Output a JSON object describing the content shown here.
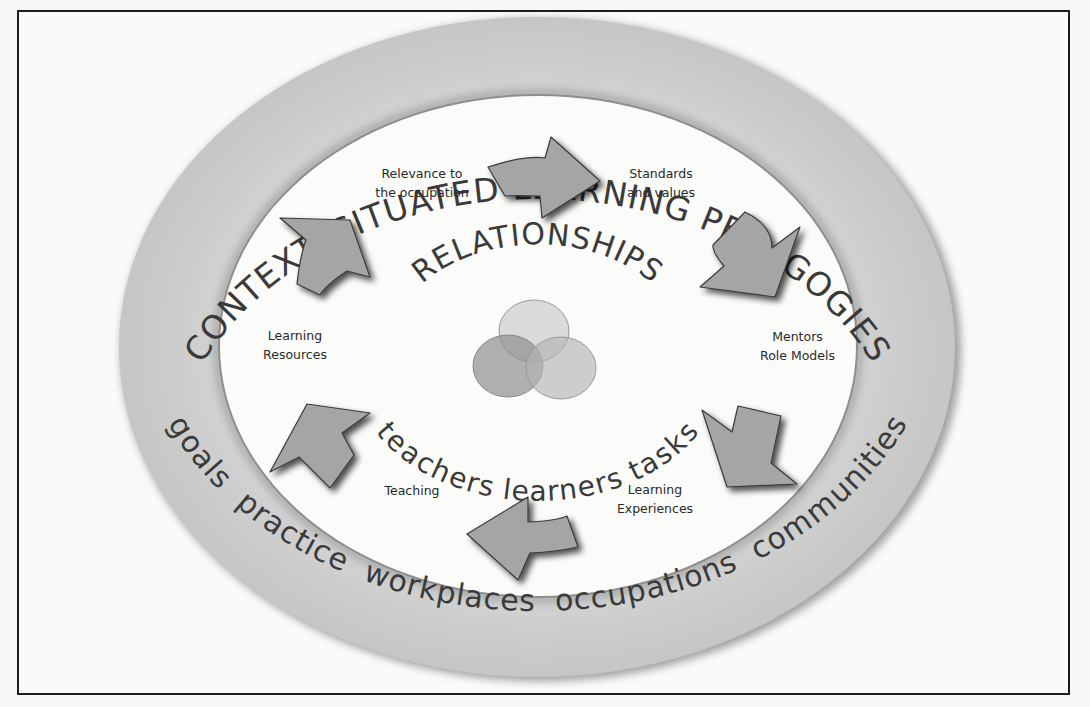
{
  "diagram": {
    "outer_ring": {
      "top_text": "CONTEXT: SITUATED LEARNING PEDAGOGIES",
      "bottom_text": "goals  practice  workplaces  occupations  communities"
    },
    "center": {
      "title": "RELATIONSHIPS",
      "subtitle": "teachers learners tasks",
      "venn": [
        "teachers",
        "learners",
        "tasks"
      ]
    },
    "cycle_labels": [
      {
        "line1": "Relevance to",
        "line2": "the occupation"
      },
      {
        "line1": "Standards",
        "line2": "and values"
      },
      {
        "line1": "Mentors",
        "line2": "Role Models"
      },
      {
        "line1": "Learning",
        "line2": "Experiences"
      },
      {
        "line1": "Teaching",
        "line2": ""
      },
      {
        "line1": "Learning",
        "line2": "Resources"
      }
    ],
    "colors": {
      "ring": "#c9c9c9",
      "ring_shadow": "#4a4a4a",
      "arrow_fill": "#a3a3a3",
      "arrow_stroke": "#3a3a3a",
      "text": "#3a3a3a",
      "background": "#fafaf8"
    }
  }
}
